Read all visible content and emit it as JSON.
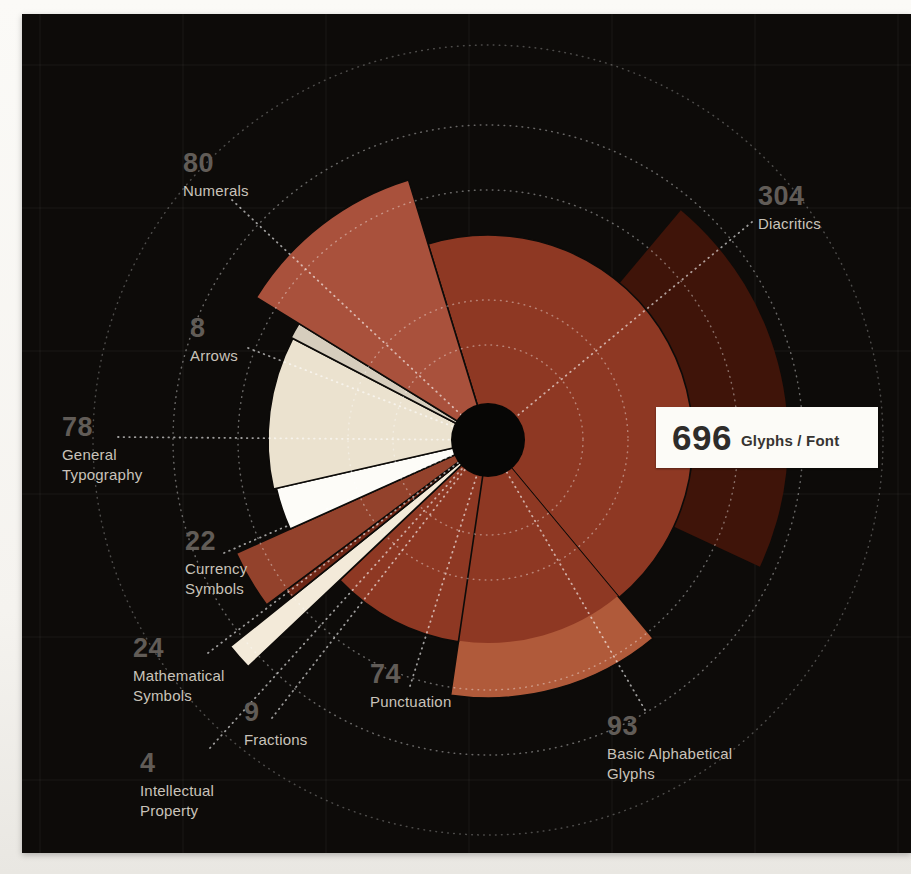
{
  "chart_data": {
    "type": "pie",
    "title": "Glyph categories per font",
    "total": 696,
    "center_label": {
      "value": "696",
      "unit": "Glyphs / Font"
    },
    "categories": [
      {
        "name": "Diacritics",
        "count": 304,
        "color": "#8e3823",
        "radius_px": 205,
        "outer_arc": {
          "start_deg": 40,
          "end_deg": 115,
          "radius_px": 300,
          "color": "#3f1409"
        }
      },
      {
        "name": "Basic Alphabetical Glyphs",
        "count": 93,
        "color": "#b05a3a",
        "radius_px": 258,
        "inner_radius_px": 203,
        "inner_color": "#8e3823"
      },
      {
        "name": "Punctuation",
        "count": 74,
        "color": "#8e3823",
        "radius_px": 204
      },
      {
        "name": "Fractions",
        "count": 9,
        "color": "#f3ead9",
        "radius_px": 330
      },
      {
        "name": "Intellectual Property",
        "count": 4,
        "color": "#6e2615",
        "radius_px": 252
      },
      {
        "name": "Mathematical Symbols",
        "count": 24,
        "color": "#93422c",
        "radius_px": 276
      },
      {
        "name": "Currency Symbols",
        "count": 22,
        "color": "#fdfcf8",
        "radius_px": 217
      },
      {
        "name": "General Typography",
        "count": 78,
        "color": "#ebe2cf",
        "radius_px": 220
      },
      {
        "name": "Arrows",
        "count": 8,
        "color": "#d6cdbd",
        "radius_px": 222
      },
      {
        "name": "Numerals",
        "count": 80,
        "color": "#a9513c",
        "radius_px": 272
      }
    ],
    "layout": {
      "start_angle_deg": 343,
      "clockwise": true,
      "center_px": [
        466,
        426
      ],
      "hole_radius_px": 37,
      "hole_color": "#070605",
      "ring_radii_px": [
        95,
        140,
        250,
        315,
        395
      ],
      "grid_spacing_px": 143,
      "grid_origin_px": [
        18,
        51
      ],
      "legend_position": "radial-labels"
    }
  },
  "labels": [
    {
      "id": "diacritics",
      "value": "304",
      "lines": [
        "Diacritics"
      ],
      "x": 736,
      "y": 168,
      "leader": [
        730,
        208
      ]
    },
    {
      "id": "basic-alphabetical",
      "value": "93",
      "lines": [
        "Basic Alphabetical",
        "Glyphs"
      ],
      "x": 585,
      "y": 698,
      "leader": [
        623,
        696
      ]
    },
    {
      "id": "punctuation",
      "value": "74",
      "lines": [
        "Punctuation"
      ],
      "x": 348,
      "y": 646,
      "leader": [
        388,
        672
      ]
    },
    {
      "id": "fractions",
      "value": "9",
      "lines": [
        "Fractions"
      ],
      "x": 222,
      "y": 684,
      "leader": [
        250,
        704
      ]
    },
    {
      "id": "intellectual-property",
      "value": "4",
      "lines": [
        "Intellectual",
        "Property"
      ],
      "x": 118,
      "y": 735,
      "leader": [
        188,
        734
      ]
    },
    {
      "id": "mathematical-symbols",
      "value": "24",
      "lines": [
        "Mathematical",
        "Symbols"
      ],
      "x": 111,
      "y": 620,
      "leader": [
        186,
        639
      ]
    },
    {
      "id": "currency-symbols",
      "value": "22",
      "lines": [
        "Currency",
        "Symbols"
      ],
      "x": 163,
      "y": 513,
      "leader": [
        202,
        539
      ]
    },
    {
      "id": "general-typography",
      "value": "78",
      "lines": [
        "General",
        "Typography"
      ],
      "x": 40,
      "y": 399,
      "leader": [
        96,
        423
      ]
    },
    {
      "id": "arrows",
      "value": "8",
      "lines": [
        "Arrows"
      ],
      "x": 168,
      "y": 300,
      "leader": [
        226,
        334
      ]
    },
    {
      "id": "numerals",
      "value": "80",
      "lines": [
        "Numerals"
      ],
      "x": 161,
      "y": 135,
      "leader": [
        210,
        186
      ]
    }
  ],
  "colors": {
    "panel_background": "#0d0b09",
    "number_text": "#615c57",
    "name_text": "#c9c3ba",
    "leader_dots": "rgba(255,255,255,0.60)",
    "ring_dots": "rgba(255,255,255,0.38)",
    "grid_lines": "rgba(255,255,255,0.055)",
    "box_background": "#fcfbf7",
    "box_text": "#2e2c2a"
  }
}
